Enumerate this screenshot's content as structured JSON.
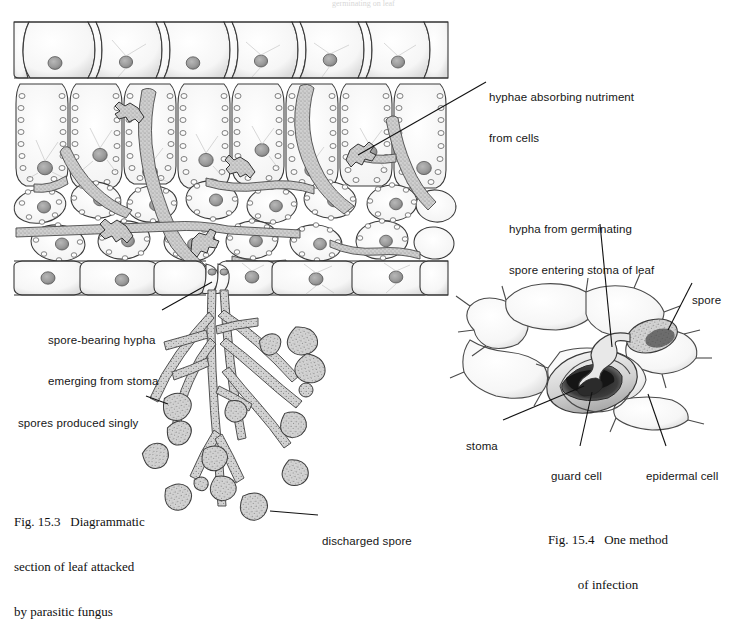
{
  "page": {
    "background": "#ffffff",
    "ink": "#161616",
    "hypha_fill": "#b9b9b9",
    "spore_fill": "#c3c3c3",
    "nucleus_fill": "#9a9a9a",
    "cell_stroke": "#3a3a3a",
    "top_faint_text": "germinating on leaf"
  },
  "figures": {
    "fig_left": {
      "caption_lines": [
        "Fig. 15.3   Diagrammatic",
        "section of leaf attacked",
        "by parasitic fungus"
      ],
      "caption_x": 14,
      "caption_y": 484
    },
    "fig_right": {
      "caption_lines": [
        "Fig. 15.4   One method",
        "of infection"
      ],
      "caption_x": 530,
      "caption_y": 502
    }
  },
  "labels": [
    {
      "id": "hyphae-absorbing",
      "lines": [
        "hyphae absorbing nutriment",
        "from cells"
      ],
      "x": 489,
      "y": 64,
      "leader": {
        "x1": 486,
        "y1": 82,
        "x2": 358,
        "y2": 155
      }
    },
    {
      "id": "hypha-germinating",
      "lines": [
        "hypha from germinating",
        "spore entering stoma of leaf"
      ],
      "x": 509,
      "y": 196,
      "leader": {
        "x1": 600,
        "y1": 224,
        "x2": 612,
        "y2": 347
      }
    },
    {
      "id": "spore-right",
      "lines": [
        "spore"
      ],
      "x": 692,
      "y": 267,
      "leader": {
        "x1": 692,
        "y1": 283,
        "x2": 668,
        "y2": 330
      }
    },
    {
      "id": "spore-bearing-hypha",
      "lines": [
        "spore-bearing hypha",
        "emerging from stoma"
      ],
      "x": 48,
      "y": 307,
      "leader": {
        "x1": 160,
        "y1": 310,
        "x2": 212,
        "y2": 281
      }
    },
    {
      "id": "spores-singly",
      "lines": [
        "spores produced singly"
      ],
      "x": 18,
      "y": 390,
      "leader": {
        "x1": 145,
        "y1": 396,
        "x2": 166,
        "y2": 404
      }
    },
    {
      "id": "discharged-spore",
      "lines": [
        "discharged spore"
      ],
      "x": 322,
      "y": 511,
      "leader": {
        "x1": 318,
        "y1": 516,
        "x2": 272,
        "y2": 512
      }
    },
    {
      "id": "stoma",
      "lines": [
        "stoma"
      ],
      "x": 466,
      "y": 418,
      "leader": {
        "x1": 503,
        "y1": 421,
        "x2": 584,
        "y2": 385
      }
    },
    {
      "id": "guard-cell",
      "lines": [
        "guard cell"
      ],
      "x": 551,
      "y": 450,
      "leader": {
        "x1": 580,
        "y1": 447,
        "x2": 592,
        "y2": 392
      }
    },
    {
      "id": "epidermal-cell",
      "lines": [
        "epidermal cell"
      ],
      "x": 646,
      "y": 450,
      "leader": {
        "x1": 667,
        "y1": 447,
        "x2": 648,
        "y2": 393
      }
    }
  ],
  "diagram_left": {
    "name": "leaf-section-attacked-by-fungus",
    "structures": [
      "upper-epidermis",
      "palisade-mesophyll",
      "spongy-mesophyll",
      "lower-epidermis",
      "stoma",
      "intercellular-hyphae",
      "haustoria",
      "spore-bearing-hypha",
      "spores"
    ],
    "upper_epidermis_cells": 8,
    "palisade_cells": 7,
    "spore_count": 14
  },
  "diagram_right": {
    "name": "stoma-surface-view-infection",
    "structures": [
      "epidermal-cells",
      "guard-cells",
      "stoma-pore",
      "germinating-spore",
      "germ-tube-hypha"
    ],
    "epidermal_cell_count": 7
  }
}
